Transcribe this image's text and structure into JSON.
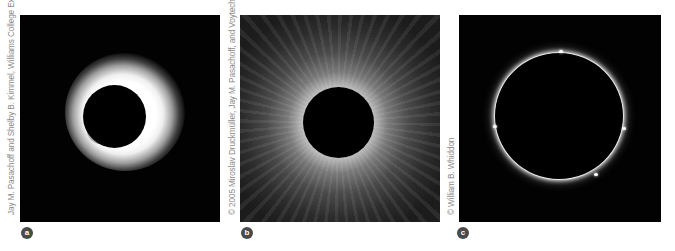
{
  "figure": {
    "panels": [
      {
        "label": "a",
        "credit": "Jay M. Pasachoff and Shelby B. Kimmel, Williams College Expedition",
        "description": "Solar eclipse with bright diffuse inner corona"
      },
      {
        "label": "b",
        "credit": "© 2005 Miroslav Druckmüller, Jay M. Pasachoff, and Voytech Rušin",
        "description": "Total solar eclipse with extended streamer corona"
      },
      {
        "label": "c",
        "credit": "© William B. Whiddon",
        "description": "Eclipse showing thin chromosphere ring"
      }
    ],
    "colors": {
      "background": "#ffffff",
      "photo_background": "#020202",
      "credit_text": "#8a8a8a",
      "badge": "#4a4a4a"
    }
  }
}
